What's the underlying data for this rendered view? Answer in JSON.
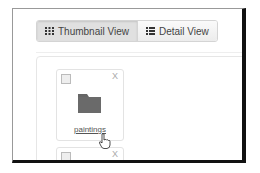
{
  "toolbar": {
    "buttons": [
      {
        "label": "Thumbnail View",
        "icon": "grid-icon",
        "active": true
      },
      {
        "label": "Detail View",
        "icon": "list-icon",
        "active": false
      }
    ]
  },
  "items": [
    {
      "name": "paintings",
      "type": "folder",
      "checked": false,
      "delete_label": "X"
    },
    {
      "name": "",
      "type": "folder",
      "checked": false,
      "delete_label": "X"
    }
  ],
  "colors": {
    "folder": "#666666",
    "frame_shadow": "#111111"
  }
}
